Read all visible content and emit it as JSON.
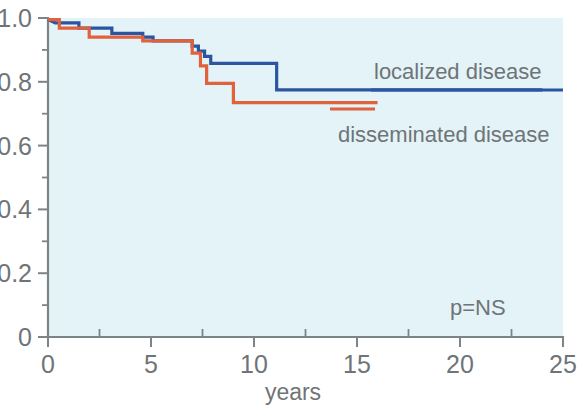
{
  "figure": {
    "background_color": "#ffffff",
    "plot_background_color": "#e3f3f7",
    "axis_color": "#7d8488",
    "text_color": "#6f7477"
  },
  "annotations": {
    "p_value": "p=NS"
  },
  "legend": {
    "items": [
      {
        "label": "localized disease",
        "color": "#2b55a0"
      },
      {
        "label": "disseminated disease",
        "color": "#e0613c"
      }
    ]
  },
  "chart_data": {
    "type": "line",
    "subtype": "kaplan-meier-step",
    "title": "",
    "xlabel": "years",
    "ylabel": "",
    "xlim": [
      0,
      25
    ],
    "ylim": [
      0,
      1.0
    ],
    "grid": false,
    "legend_position": "inside-right",
    "xticks": [
      0,
      5,
      10,
      15,
      20,
      25
    ],
    "xtick_labels": [
      "0",
      "5",
      "10",
      "15",
      "20",
      "25"
    ],
    "xticks_minor": [
      2.5,
      7.5,
      12.5,
      17.5,
      22.5
    ],
    "yticks": [
      0,
      0.2,
      0.4,
      0.6,
      0.8,
      1.0
    ],
    "ytick_labels": [
      "0",
      "0.2",
      "0.4",
      "0.6",
      "0.8",
      "1.0"
    ],
    "yticks_minor": [
      0.1,
      0.3,
      0.5,
      0.7,
      0.9
    ],
    "series": [
      {
        "name": "localized disease",
        "color": "#2b55a0",
        "points": [
          [
            0.0,
            0.995
          ],
          [
            0.35,
            0.985
          ],
          [
            1.5,
            0.985
          ],
          [
            1.5,
            0.968
          ],
          [
            3.1,
            0.968
          ],
          [
            3.1,
            0.952
          ],
          [
            4.6,
            0.952
          ],
          [
            4.6,
            0.94
          ],
          [
            5.1,
            0.94
          ],
          [
            5.1,
            0.928
          ],
          [
            7.0,
            0.928
          ],
          [
            7.0,
            0.912
          ],
          [
            7.3,
            0.912
          ],
          [
            7.3,
            0.896
          ],
          [
            7.6,
            0.896
          ],
          [
            7.6,
            0.88
          ],
          [
            7.9,
            0.88
          ],
          [
            7.9,
            0.858
          ],
          [
            11.1,
            0.858
          ],
          [
            11.1,
            0.775
          ],
          [
            24.0,
            0.775
          ]
        ]
      },
      {
        "name": "disseminated disease",
        "color": "#e0613c",
        "points": [
          [
            0.0,
            0.995
          ],
          [
            0.55,
            0.995
          ],
          [
            0.55,
            0.968
          ],
          [
            2.0,
            0.968
          ],
          [
            2.0,
            0.94
          ],
          [
            4.6,
            0.94
          ],
          [
            4.6,
            0.928
          ],
          [
            7.0,
            0.928
          ],
          [
            7.0,
            0.89
          ],
          [
            7.4,
            0.89
          ],
          [
            7.4,
            0.85
          ],
          [
            7.7,
            0.85
          ],
          [
            7.7,
            0.795
          ],
          [
            9.0,
            0.795
          ],
          [
            9.0,
            0.735
          ],
          [
            16.0,
            0.735
          ]
        ]
      }
    ]
  }
}
